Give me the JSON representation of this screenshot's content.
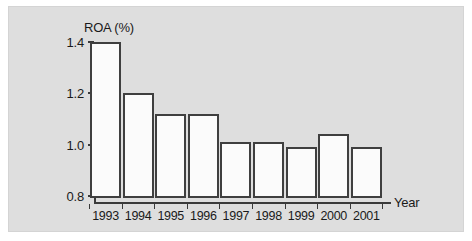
{
  "chart_data": {
    "type": "bar",
    "title": "ROA (%)",
    "xlabel": "Year",
    "ylabel": "",
    "categories": [
      "1993",
      "1994",
      "1995",
      "1996",
      "1997",
      "1998",
      "1999",
      "2000",
      "2001"
    ],
    "values": [
      1.4,
      1.2,
      1.12,
      1.12,
      1.01,
      1.01,
      0.99,
      1.04,
      0.99
    ],
    "ylim": [
      0.8,
      1.4
    ],
    "yticks": [
      "1.4",
      "1.2",
      "1.0",
      "0.8"
    ],
    "ytick_values": [
      1.4,
      1.2,
      1.0,
      0.8
    ],
    "grid": false,
    "legend": null,
    "series": [
      {
        "name": "ROA (%)",
        "values": [
          1.4,
          1.2,
          1.12,
          1.12,
          1.01,
          1.01,
          0.99,
          1.04,
          0.99
        ]
      }
    ]
  },
  "style": {
    "panel_background": "#dedede",
    "bar_fill": "#fbfbfb",
    "bar_border": "#3f3f3f",
    "axis_color": "#3a3a3a",
    "text_color": "#1a1a1a"
  }
}
